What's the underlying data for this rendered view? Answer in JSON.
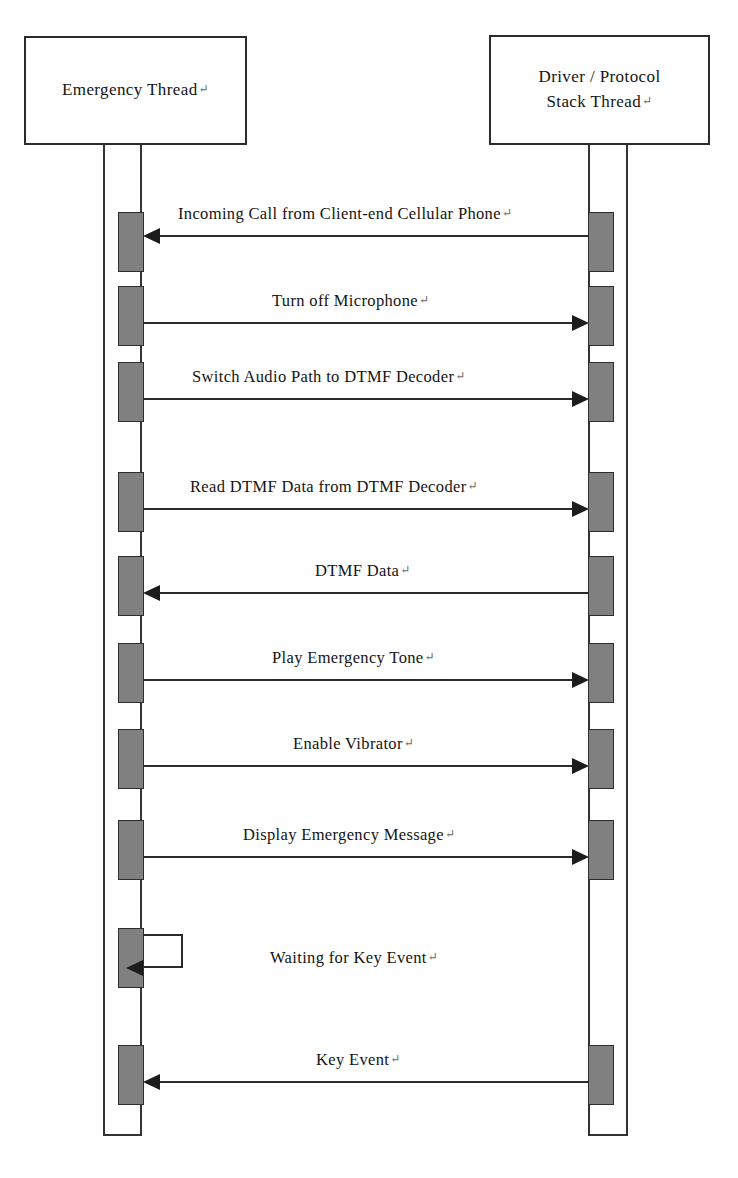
{
  "diagram": {
    "type": "uml-sequence-diagram",
    "background_color": "#ffffff",
    "line_color": "#2b2b2b",
    "activation_fill": "#808080",
    "activation_border": "#2e2e2e",
    "text_color": "#141414",
    "return_mark": "↵"
  },
  "participants": [
    {
      "id": "emergency-thread",
      "lines": [
        "Emergency Thread"
      ],
      "return_mark": "↵",
      "box": {
        "x": 24,
        "y": 36,
        "w": 223,
        "h": 109
      },
      "lifeline": {
        "x": 103,
        "w": 39,
        "top": 145,
        "bottom": 1136
      }
    },
    {
      "id": "driver-protocol-stack-thread",
      "lines": [
        "Driver / Protocol",
        "Stack Thread"
      ],
      "return_mark": "↵",
      "box": {
        "x": 489,
        "y": 35,
        "w": 221,
        "h": 110
      },
      "lifeline": {
        "x": 588,
        "w": 40,
        "top": 145,
        "bottom": 1136
      }
    }
  ],
  "messages": [
    {
      "index": 1,
      "label": "Incoming Call from Client-end Cellular Phone",
      "return_mark": "↵",
      "direction": "right-to-left",
      "from": "driver-protocol-stack-thread",
      "to": "emergency-thread",
      "y": 235,
      "label_x": 178,
      "label_y": 206
    },
    {
      "index": 2,
      "label": "Turn off Microphone",
      "return_mark": "↵",
      "direction": "left-to-right",
      "from": "emergency-thread",
      "to": "driver-protocol-stack-thread",
      "y": 322,
      "label_x": 272,
      "label_y": 293
    },
    {
      "index": 3,
      "label": "Switch Audio Path to DTMF Decoder",
      "return_mark": "↵",
      "direction": "left-to-right",
      "from": "emergency-thread",
      "to": "driver-protocol-stack-thread",
      "y": 398,
      "label_x": 192,
      "label_y": 369
    },
    {
      "index": 4,
      "label": "Read DTMF Data from DTMF Decoder",
      "return_mark": "↵",
      "direction": "left-to-right",
      "from": "emergency-thread",
      "to": "driver-protocol-stack-thread",
      "y": 508,
      "label_x": 190,
      "label_y": 479
    },
    {
      "index": 5,
      "label": "DTMF Data",
      "return_mark": "↵",
      "direction": "right-to-left",
      "from": "driver-protocol-stack-thread",
      "to": "emergency-thread",
      "y": 592,
      "label_x": 315,
      "label_y": 563
    },
    {
      "index": 6,
      "label": "Play Emergency Tone",
      "return_mark": "↵",
      "direction": "left-to-right",
      "from": "emergency-thread",
      "to": "driver-protocol-stack-thread",
      "y": 679,
      "label_x": 272,
      "label_y": 650
    },
    {
      "index": 7,
      "label": "Enable Vibrator",
      "return_mark": "↵",
      "direction": "left-to-right",
      "from": "emergency-thread",
      "to": "driver-protocol-stack-thread",
      "y": 765,
      "label_x": 293,
      "label_y": 736
    },
    {
      "index": 8,
      "label": "Display Emergency Message",
      "return_mark": "↵",
      "direction": "left-to-right",
      "from": "emergency-thread",
      "to": "driver-protocol-stack-thread",
      "y": 856,
      "label_x": 243,
      "label_y": 827
    },
    {
      "index": 9,
      "label": "Waiting for Key Event",
      "return_mark": "↵",
      "direction": "self",
      "from": "emergency-thread",
      "to": "emergency-thread",
      "y": 964,
      "label_x": 270,
      "label_y": 950,
      "loop": {
        "x": 143,
        "y": 934,
        "w": 40,
        "h": 34
      }
    },
    {
      "index": 10,
      "label": "Key Event",
      "return_mark": "↵",
      "direction": "right-to-left",
      "from": "driver-protocol-stack-thread",
      "to": "emergency-thread",
      "y": 1081,
      "label_x": 316,
      "label_y": 1052
    }
  ],
  "activations": {
    "left": [
      {
        "x": 118,
        "y": 212,
        "w": 26,
        "h": 60
      },
      {
        "x": 118,
        "y": 286,
        "w": 26,
        "h": 60
      },
      {
        "x": 118,
        "y": 362,
        "w": 26,
        "h": 60
      },
      {
        "x": 118,
        "y": 472,
        "w": 26,
        "h": 60
      },
      {
        "x": 118,
        "y": 556,
        "w": 26,
        "h": 60
      },
      {
        "x": 118,
        "y": 643,
        "w": 26,
        "h": 60
      },
      {
        "x": 118,
        "y": 729,
        "w": 26,
        "h": 60
      },
      {
        "x": 118,
        "y": 820,
        "w": 26,
        "h": 60
      },
      {
        "x": 118,
        "y": 928,
        "w": 26,
        "h": 60
      },
      {
        "x": 118,
        "y": 1045,
        "w": 26,
        "h": 60
      }
    ],
    "right": [
      {
        "x": 588,
        "y": 212,
        "w": 26,
        "h": 60
      },
      {
        "x": 588,
        "y": 286,
        "w": 26,
        "h": 60
      },
      {
        "x": 588,
        "y": 362,
        "w": 26,
        "h": 60
      },
      {
        "x": 588,
        "y": 472,
        "w": 26,
        "h": 60
      },
      {
        "x": 588,
        "y": 556,
        "w": 26,
        "h": 60
      },
      {
        "x": 588,
        "y": 643,
        "w": 26,
        "h": 60
      },
      {
        "x": 588,
        "y": 729,
        "w": 26,
        "h": 60
      },
      {
        "x": 588,
        "y": 820,
        "w": 26,
        "h": 60
      },
      {
        "x": 588,
        "y": 1045,
        "w": 26,
        "h": 60
      }
    ]
  }
}
